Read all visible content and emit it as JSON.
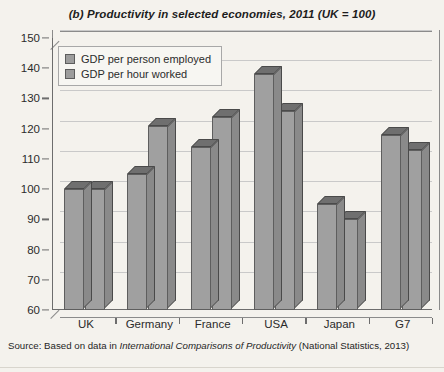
{
  "chart_data": {
    "type": "bar",
    "title": "(b) Productivity in selected economies, 2011 (UK = 100)",
    "xlabel": "",
    "ylabel": "",
    "ylim": [
      60,
      150
    ],
    "ytick_step": 10,
    "yticks": [
      60,
      70,
      80,
      90,
      100,
      110,
      120,
      130,
      140,
      150
    ],
    "grid": true,
    "legend_position": "upper-left-inside",
    "categories": [
      "UK",
      "Germany",
      "France",
      "USA",
      "Japan",
      "G7"
    ],
    "series": [
      {
        "name": "GDP per person employed",
        "color": "#a0a0a0",
        "values": [
          100,
          105,
          114,
          138,
          95,
          118
        ]
      },
      {
        "name": "GDP per hour worked",
        "color": "#a0a0a0",
        "values": [
          100,
          121,
          124,
          126,
          90,
          113
        ]
      }
    ],
    "source": {
      "prefix": "Source: Based on data in ",
      "italic": "International Comparisons of Productivity",
      "suffix": " (National Statistics, 2013)"
    }
  }
}
